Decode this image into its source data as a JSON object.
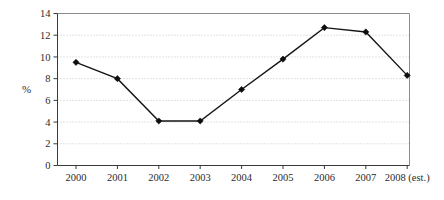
{
  "chart_data": {
    "type": "line",
    "title": "",
    "xlabel": "",
    "ylabel": "%",
    "categories": [
      "2000",
      "2001",
      "2002",
      "2003",
      "2004",
      "2005",
      "2006",
      "2007",
      "2008 (est.)"
    ],
    "values": [
      9.5,
      8.0,
      4.1,
      4.1,
      7.0,
      9.8,
      12.7,
      12.3,
      8.3
    ],
    "series": [
      {
        "name": "",
        "values": [
          9.5,
          8.0,
          4.1,
          4.1,
          7.0,
          9.8,
          12.7,
          12.3,
          8.3
        ]
      }
    ],
    "ylim": [
      0,
      14
    ],
    "ytick_step": 2,
    "yticks": [
      "0",
      "2",
      "4",
      "6",
      "8",
      "10",
      "12",
      "14"
    ],
    "grid": true,
    "grid_axis": "y",
    "grid_style": "dotted",
    "legend": false,
    "legend_position": "none",
    "marker": "diamond",
    "line_color": "#151515",
    "marker_color": "#0d0d0d",
    "grid_color": "#b9b9b9",
    "frame_color": "#8c8c8c",
    "axis_color": "#3a3a3a",
    "background_color": "#ffffff"
  },
  "axis": {
    "y_label": "%"
  }
}
